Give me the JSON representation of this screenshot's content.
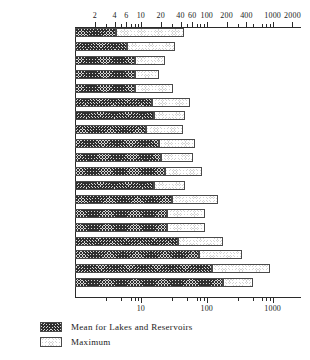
{
  "chart_data": {
    "type": "bar",
    "orientation": "horizontal",
    "stacked": true,
    "scale": "log",
    "title": "",
    "xlabel": "",
    "ylabel": "",
    "xlim": [
      1,
      2600
    ],
    "grid": false,
    "legend_position": "bottom-left",
    "axis_top_ticks": [
      {
        "value": 2,
        "label": "2"
      },
      {
        "value": 4,
        "label": "4"
      },
      {
        "value": 6,
        "label": "6"
      },
      {
        "value": 10,
        "label": "10"
      },
      {
        "value": 20,
        "label": "20"
      },
      {
        "value": 40,
        "label": "40"
      },
      {
        "value": 60,
        "label": "60"
      },
      {
        "value": 100,
        "label": "100"
      },
      {
        "value": 200,
        "label": "200"
      },
      {
        "value": 400,
        "label": "400"
      },
      {
        "value": 1000,
        "label": "1000"
      },
      {
        "value": 2000,
        "label": "2000"
      }
    ],
    "axis_bottom_ticks": [
      {
        "value": 10,
        "label": "10"
      },
      {
        "value": 100,
        "label": "100"
      },
      {
        "value": 1000,
        "label": "1000"
      }
    ],
    "axis_minor_ticks": [
      3,
      5,
      7,
      8,
      9,
      30,
      50,
      70,
      80,
      90,
      300,
      500,
      700,
      800,
      900
    ],
    "categories": [
      "Trout",
      "Walleye",
      "Rock Bass",
      "Pike",
      "Y. Perch",
      "Lm. Bass",
      "Ch. Catfish",
      "Pumpkinseed",
      "Quillbacks",
      "Drum",
      "Bowfin",
      "Crappies",
      "Suckers",
      "Bluegill",
      "Sunfishes",
      "Bullheads",
      "Carp",
      "Buffaloes",
      "Giz. Shad"
    ],
    "series": [
      {
        "name": "Mean for Lakes and Reservoirs",
        "pattern": "crosshatch-dark",
        "values": [
          4.2,
          6.2,
          8.0,
          8.0,
          8.2,
          15.0,
          16.0,
          12.0,
          19.0,
          20.0,
          23.0,
          16.0,
          30.0,
          25.0,
          25.0,
          37.0,
          75.0,
          120.0,
          175.0
        ]
      },
      {
        "name": "Maximum",
        "pattern": "stipple-light",
        "values": [
          45.0,
          33.0,
          23.0,
          19.0,
          31.0,
          56.0,
          46.0,
          43.0,
          66.0,
          62.0,
          84.0,
          47.0,
          150.0,
          95.0,
          94.0,
          175.0,
          340.0,
          900.0,
          500.0
        ]
      }
    ],
    "legend": [
      {
        "label": "Mean for Lakes and Reservoirs",
        "pattern": "crosshatch-dark"
      },
      {
        "label": "Maximum",
        "pattern": "stipple-light"
      }
    ]
  }
}
